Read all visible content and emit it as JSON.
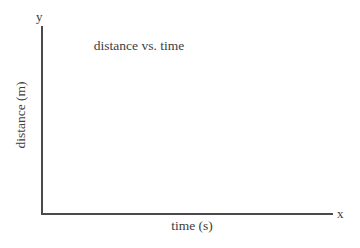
{
  "figure": {
    "background_color": "#ffffff",
    "line_color": "#4a4a4a",
    "text_color": "#3d3d3d",
    "width": 360,
    "height": 248
  },
  "chart_data": {
    "type": "line",
    "title": "distance vs. time",
    "subtitle": "",
    "xlabel": "time (s)",
    "ylabel": "distance (m)",
    "x_axis_letter": "x",
    "y_axis_letter": "y",
    "series": [],
    "x": [],
    "categories": [],
    "values": [],
    "xticks": [],
    "yticks": [],
    "xticklabels": [],
    "yticklabels": [],
    "xlim": null,
    "ylim": null,
    "grid": false,
    "legend": false,
    "legend_position": "none",
    "annotations": []
  }
}
